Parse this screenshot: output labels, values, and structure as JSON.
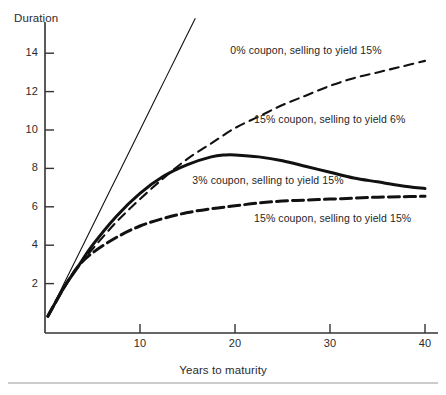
{
  "figure": {
    "y_axis_title": "Duration",
    "x_axis_title": "Years to maturity"
  },
  "chart_data": {
    "type": "line",
    "title": "",
    "xlabel": "Years to maturity",
    "ylabel": "Duration",
    "xlim": [
      0,
      41
    ],
    "ylim": [
      0,
      15
    ],
    "xticks": [
      10,
      20,
      30,
      40
    ],
    "yticks": [
      2,
      4,
      6,
      8,
      10,
      12,
      14
    ],
    "grid": false,
    "legend": "inline-annotations",
    "series": [
      {
        "name": "0% coupon, selling to yield 15%",
        "style": "thin-solid",
        "x": [
          0.3,
          2,
          4,
          6,
          8,
          10,
          12,
          14,
          15.8
        ],
        "values": [
          0.3,
          2.0,
          4.0,
          6.0,
          8.0,
          10.0,
          12.0,
          14.0,
          15.8
        ]
      },
      {
        "name": "15% coupon, selling to yield 6%",
        "style": "dashed",
        "x": [
          0.3,
          2,
          3.5,
          5,
          7.5,
          10,
          12.5,
          15,
          17.5,
          20,
          22.5,
          25,
          27.5,
          30,
          32.5,
          35,
          37.5,
          40
        ],
        "values": [
          0.3,
          1.8,
          2.9,
          3.8,
          5.2,
          6.4,
          7.5,
          8.5,
          9.3,
          10.1,
          10.7,
          11.3,
          11.8,
          12.3,
          12.7,
          13.0,
          13.3,
          13.6
        ]
      },
      {
        "name": "3% coupon, selling to yield 15%",
        "style": "thick-solid",
        "x": [
          0.3,
          2,
          3.5,
          5,
          7.5,
          10,
          12.5,
          15,
          17.5,
          19,
          20,
          22.5,
          25,
          27.5,
          30,
          32.5,
          35,
          37.5,
          40
        ],
        "values": [
          0.3,
          1.8,
          2.9,
          4.0,
          5.5,
          6.7,
          7.6,
          8.2,
          8.6,
          8.7,
          8.7,
          8.6,
          8.4,
          8.1,
          7.8,
          7.5,
          7.3,
          7.1,
          6.95
        ]
      },
      {
        "name": "15% coupon, selling to yield 15%",
        "style": "thick-dashed",
        "x": [
          0.3,
          2,
          3.5,
          5,
          7.5,
          10,
          12.5,
          15,
          17.5,
          20,
          22.5,
          25,
          27.5,
          30,
          32.5,
          35,
          37.5,
          40
        ],
        "values": [
          0.3,
          1.8,
          2.9,
          3.6,
          4.4,
          5.0,
          5.4,
          5.7,
          5.9,
          6.05,
          6.2,
          6.3,
          6.35,
          6.4,
          6.45,
          6.5,
          6.52,
          6.55
        ]
      }
    ],
    "annotations": [
      {
        "text": "0% coupon, selling to yield 15%",
        "x": 19.5,
        "y": 14.1
      },
      {
        "text": "15% coupon, selling to yield 6%",
        "x": 22.0,
        "y": 10.5
      },
      {
        "text": "3% coupon, selling to yield 15%",
        "x": 15.5,
        "y": 7.35
      },
      {
        "text": "15% coupon, selling to yield 15%",
        "x": 22.0,
        "y": 5.35
      }
    ]
  }
}
